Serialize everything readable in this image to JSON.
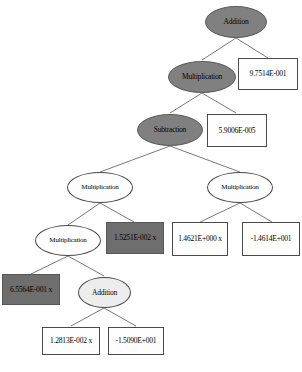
{
  "diagram": {
    "type": "expression-tree",
    "colors": {
      "node_dark_fill": "#808080",
      "node_light_fill": "#ededed",
      "node_white_fill": "#ffffff",
      "terminal_dark_fill": "#6e6e6e",
      "edge": "#555555",
      "text": "#000000"
    },
    "nodes": [
      {
        "id": "n0",
        "label": "Addition",
        "shape": "ellipse",
        "fill": "dark"
      },
      {
        "id": "n1",
        "label": "Multiplication",
        "shape": "ellipse",
        "fill": "dark"
      },
      {
        "id": "n2",
        "label": "9.7514E-001",
        "shape": "rectangle",
        "fill": "white"
      },
      {
        "id": "n3",
        "label": "Subtraction",
        "shape": "ellipse",
        "fill": "dark"
      },
      {
        "id": "n4",
        "label": "5.9006E-005",
        "shape": "rectangle",
        "fill": "white"
      },
      {
        "id": "n5",
        "label": "Multiplication",
        "shape": "ellipse",
        "fill": "white"
      },
      {
        "id": "n6",
        "label": "Multiplication",
        "shape": "ellipse",
        "fill": "white"
      },
      {
        "id": "n7",
        "label": "Multiplication",
        "shape": "ellipse",
        "fill": "white"
      },
      {
        "id": "n8",
        "label": "1.5251E-002 x",
        "shape": "rectangle",
        "fill": "dark"
      },
      {
        "id": "n9",
        "label": "1.4621E+000 x",
        "shape": "rectangle",
        "fill": "white"
      },
      {
        "id": "n10",
        "label": "-1.4614E+001",
        "shape": "rectangle",
        "fill": "white"
      },
      {
        "id": "n11",
        "label": "6.5564E-001 x",
        "shape": "rectangle",
        "fill": "dark"
      },
      {
        "id": "n12",
        "label": "Addition",
        "shape": "ellipse",
        "fill": "light"
      },
      {
        "id": "n13",
        "label": "1.2813E-002 x",
        "shape": "rectangle",
        "fill": "white"
      },
      {
        "id": "n14",
        "label": "-1.5090E+001",
        "shape": "rectangle",
        "fill": "white"
      }
    ],
    "edges": [
      {
        "from": "n0",
        "to": "n1"
      },
      {
        "from": "n0",
        "to": "n2"
      },
      {
        "from": "n1",
        "to": "n3"
      },
      {
        "from": "n1",
        "to": "n4"
      },
      {
        "from": "n3",
        "to": "n5"
      },
      {
        "from": "n3",
        "to": "n6"
      },
      {
        "from": "n5",
        "to": "n7"
      },
      {
        "from": "n5",
        "to": "n8"
      },
      {
        "from": "n6",
        "to": "n9"
      },
      {
        "from": "n6",
        "to": "n10"
      },
      {
        "from": "n7",
        "to": "n11"
      },
      {
        "from": "n7",
        "to": "n12"
      },
      {
        "from": "n12",
        "to": "n13"
      },
      {
        "from": "n12",
        "to": "n14"
      }
    ],
    "caption": ""
  }
}
